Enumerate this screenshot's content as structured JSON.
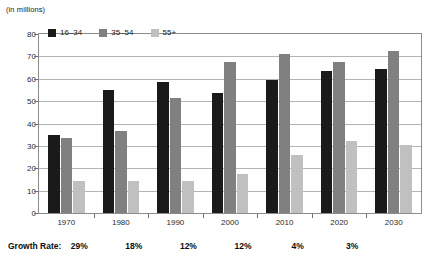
{
  "units_note": "(in millions)",
  "legend": {
    "items": [
      {
        "label": "16–34",
        "color": "#1a1a1a"
      },
      {
        "label": "35–54",
        "color": "#808080"
      },
      {
        "label": "55+",
        "color": "#c0c0c0"
      }
    ]
  },
  "growth_row": {
    "label": "Growth Rate:",
    "values": [
      "29%",
      "18%",
      "12%",
      "12%",
      "4%",
      "3%"
    ]
  },
  "chart_data": {
    "type": "bar",
    "title": "",
    "subtitle": "",
    "xlabel": "",
    "ylabel": "(in millions)",
    "ylim": [
      0,
      80
    ],
    "yticks": [
      0,
      10,
      20,
      30,
      40,
      50,
      60,
      70,
      80
    ],
    "ytick_labels": [
      "0",
      "10",
      "20",
      "30",
      "40",
      "50",
      "60",
      "70",
      "80"
    ],
    "grid": true,
    "legend_position": "top-left-inside",
    "categories": [
      "1970",
      "1980",
      "1990",
      "2000",
      "2010",
      "2020",
      "2030"
    ],
    "series": [
      {
        "name": "16–34",
        "color": "#1a1a1a",
        "values": [
          35,
          55,
          58.5,
          53.5,
          59.5,
          63.5,
          64.5
        ]
      },
      {
        "name": "35–54",
        "color": "#808080",
        "values": [
          33.5,
          36.5,
          51.5,
          67.5,
          71,
          67.5,
          72.5
        ]
      },
      {
        "name": "55+",
        "color": "#c0c0c0",
        "values": [
          14.5,
          14.5,
          14.5,
          17.5,
          26,
          32,
          30.5
        ]
      }
    ],
    "annotations": {
      "growth_rate_label": "Growth Rate:",
      "growth_rate_values": [
        "29%",
        "18%",
        "12%",
        "12%",
        "4%",
        "3%"
      ]
    }
  }
}
